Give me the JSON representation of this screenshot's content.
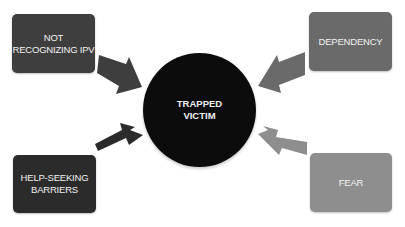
{
  "diagram": {
    "center": {
      "label": "TRAPPED\nVICTIM",
      "color": "#0c0c0c"
    },
    "factors": [
      {
        "id": "not-recognizing-ipv",
        "label": "NOT\nRECOGNIZING IPV",
        "position": "top-left",
        "color": "#3e3e3e"
      },
      {
        "id": "dependency",
        "label": "DEPENDENCY",
        "position": "top-right",
        "color": "#6a6a6a"
      },
      {
        "id": "help-seeking-barriers",
        "label": "HELP-SEEKING\nBARRIERS",
        "position": "bottom-left",
        "color": "#2b2b2b"
      },
      {
        "id": "fear",
        "label": "FEAR",
        "position": "bottom-right",
        "color": "#8e8e8e"
      }
    ],
    "arrows": [
      {
        "from": "not-recognizing-ipv",
        "to": "center",
        "color": "#3e3e3e"
      },
      {
        "from": "dependency",
        "to": "center",
        "color": "#6a6a6a"
      },
      {
        "from": "help-seeking-barriers",
        "to": "center",
        "color": "#2b2b2b"
      },
      {
        "from": "fear",
        "to": "center",
        "color": "#8e8e8e"
      }
    ]
  }
}
